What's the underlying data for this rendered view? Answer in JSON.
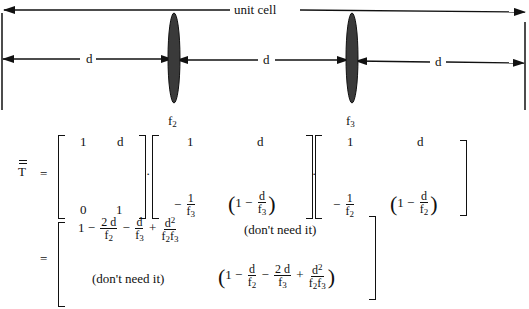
{
  "diagram": {
    "unit_cell_label": "unit cell",
    "segment_labels": [
      "d",
      "d",
      "d"
    ],
    "lenses": [
      {
        "label_base": "f",
        "label_sub": "2"
      },
      {
        "label_base": "f",
        "label_sub": "3"
      }
    ]
  },
  "equation": {
    "lhs": "T",
    "equals": "=",
    "matrix1": {
      "a11": "1",
      "a12": "d",
      "a21": "0",
      "a22": "1"
    },
    "matrix2": {
      "a11": "1",
      "a12": "d",
      "a21_sign": "−",
      "a21_num": "1",
      "a21_den": "f",
      "a21_den_sub": "3",
      "a22_one": "1 −",
      "a22_num": "d",
      "a22_den": "f",
      "a22_den_sub": "3"
    },
    "matrix3": {
      "a11": "1",
      "a12": "d",
      "a21_sign": "−",
      "a21_num": "1",
      "a21_den": "f",
      "a21_den_sub": "2",
      "a22_one": "1 −",
      "a22_num": "d",
      "a22_den": "f",
      "a22_den_sub": "2"
    },
    "result": {
      "equals": "=",
      "r11": {
        "one": "1 −",
        "t1_num": "2 d",
        "t1_den_sub": "2",
        "minus": "−",
        "t2_num": "d",
        "t2_den_sub": "3",
        "plus": "+",
        "t3_num": "d",
        "t3_num_sup": "2",
        "t3_den_sub1": "2",
        "t3_den_sub2": "3"
      },
      "r12": "(don't need it)",
      "r21": "(don't need it)",
      "r22": {
        "one": "1 −",
        "t1_num": "d",
        "t1_den_sub": "2",
        "minus": "−",
        "t2_num": "2 d",
        "t2_den_sub": "3",
        "plus": "+",
        "t3_num": "d",
        "t3_num_sup": "2",
        "t3_den_sub1": "2",
        "t3_den_sub2": "3"
      }
    },
    "dot_operator": "·",
    "f_symbol": "f"
  }
}
